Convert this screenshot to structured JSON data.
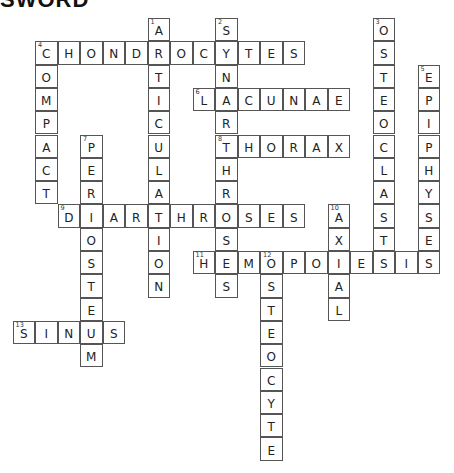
{
  "title": "SWORD",
  "words": [
    {
      "number": "1",
      "direction": "down",
      "answer": "ARTICULATION",
      "row": 0,
      "col": 5
    },
    {
      "number": "2",
      "direction": "down",
      "answer": "SYNARTHROSES",
      "row": 0,
      "col": 8
    },
    {
      "number": "3",
      "direction": "down",
      "answer": "OSTEOCLASTS",
      "row": 0,
      "col": 15
    },
    {
      "number": "4",
      "direction": "across",
      "answer": "CHONDROCYTES",
      "row": 1,
      "col": 0
    },
    {
      "number": "4",
      "direction": "down",
      "answer": "COMPACT",
      "row": 1,
      "col": 0
    },
    {
      "number": "5",
      "direction": "down",
      "answer": "EPIPHYSES",
      "row": 2,
      "col": 17
    },
    {
      "number": "6",
      "direction": "across",
      "answer": "LACUNAE",
      "row": 3,
      "col": 7
    },
    {
      "number": "7",
      "direction": "down",
      "answer": "PERIOSTEUM",
      "row": 5,
      "col": 2
    },
    {
      "number": "8",
      "direction": "across",
      "answer": "THORAX",
      "row": 5,
      "col": 8
    },
    {
      "number": "9",
      "direction": "across",
      "answer": "DIARTHROSES",
      "row": 8,
      "col": 1
    },
    {
      "number": "10",
      "direction": "down",
      "answer": "AXIAL",
      "row": 8,
      "col": 13
    },
    {
      "number": "11",
      "direction": "across",
      "answer": "HEMOPOIESIS",
      "row": 10,
      "col": 7
    },
    {
      "number": "12",
      "direction": "down",
      "answer": "OSTEOCYTE",
      "row": 10,
      "col": 10
    },
    {
      "number": "13",
      "direction": "across",
      "answer": "SINUS",
      "row": 13,
      "col": -1
    }
  ]
}
